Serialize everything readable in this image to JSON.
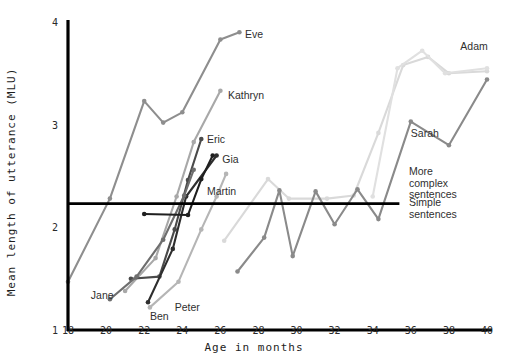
{
  "chart_data": {
    "type": "line",
    "title": "",
    "xlabel": "Age in months",
    "ylabel": "Mean length of utterance (MLU)",
    "xlim": [
      18,
      40
    ],
    "ylim": [
      1,
      4
    ],
    "xticks": [
      18,
      20,
      22,
      24,
      26,
      28,
      30,
      32,
      34,
      36,
      38,
      40
    ],
    "yticks": [
      1,
      2,
      3,
      4
    ],
    "grid": false,
    "legend_position": "inline-end-labels",
    "threshold": {
      "value": 2.23,
      "above_label": "More\ncomplex\nsentences",
      "below_label": "Simple\nsentences",
      "x_start": 18,
      "x_end": 35.4
    },
    "series": [
      {
        "name": "Eve",
        "color": "#8e8e8e",
        "label_x": 27.3,
        "label_y": 3.88,
        "points": [
          {
            "x": 18.0,
            "y": 1.47
          },
          {
            "x": 20.2,
            "y": 2.28
          },
          {
            "x": 22.0,
            "y": 3.23
          },
          {
            "x": 23.0,
            "y": 3.02
          },
          {
            "x": 24.0,
            "y": 3.12
          },
          {
            "x": 26.0,
            "y": 3.83
          },
          {
            "x": 27.0,
            "y": 3.9
          }
        ]
      },
      {
        "name": "Kathryn",
        "color": "#a8a8a8",
        "label_x": 26.4,
        "label_y": 3.29,
        "points": [
          {
            "x": 21.0,
            "y": 1.38
          },
          {
            "x": 22.6,
            "y": 1.7
          },
          {
            "x": 23.7,
            "y": 2.3
          },
          {
            "x": 24.6,
            "y": 2.83
          },
          {
            "x": 26.0,
            "y": 3.33
          }
        ]
      },
      {
        "name": "Eric",
        "color": "#4a4a4a",
        "label_x": 25.3,
        "label_y": 2.86,
        "points": [
          {
            "x": 21.3,
            "y": 1.5
          },
          {
            "x": 22.8,
            "y": 1.52
          },
          {
            "x": 23.6,
            "y": 1.98
          },
          {
            "x": 24.3,
            "y": 2.46
          },
          {
            "x": 25.0,
            "y": 2.86
          }
        ]
      },
      {
        "name": "Gia",
        "color": "#2e2e2e",
        "label_x": 26.1,
        "label_y": 2.67,
        "points": [
          {
            "x": 22.2,
            "y": 1.27
          },
          {
            "x": 23.5,
            "y": 1.79
          },
          {
            "x": 24.2,
            "y": 2.3
          },
          {
            "x": 25.8,
            "y": 2.7
          }
        ]
      },
      {
        "name": "Jane",
        "color": "#6e6e6e",
        "label_x": 19.2,
        "label_y": 1.34,
        "points": [
          {
            "x": 20.2,
            "y": 1.3
          },
          {
            "x": 21.6,
            "y": 1.52
          },
          {
            "x": 23.0,
            "y": 1.88
          },
          {
            "x": 24.1,
            "y": 2.31
          },
          {
            "x": 24.6,
            "y": 2.56
          }
        ]
      },
      {
        "name": "Ben",
        "color": "#b5b5b5",
        "label_x": 22.3,
        "label_y": 1.14,
        "points": [
          {
            "x": 22.3,
            "y": 1.22
          },
          {
            "x": 23.8,
            "y": 1.47
          },
          {
            "x": 25.0,
            "y": 1.98
          },
          {
            "x": 25.8,
            "y": 2.3
          },
          {
            "x": 26.3,
            "y": 2.52
          }
        ]
      },
      {
        "name": "Peter",
        "color": "#1f1f1f",
        "label_x": 23.6,
        "label_y": 1.22,
        "points": [
          {
            "x": 22.0,
            "y": 2.13
          },
          {
            "x": 24.3,
            "y": 2.12
          },
          {
            "x": 25.0,
            "y": 2.47
          },
          {
            "x": 25.6,
            "y": 2.7
          }
        ]
      },
      {
        "name": "Martin",
        "color": "#d9d9d9",
        "label_x": 25.3,
        "label_y": 2.35,
        "points": [
          {
            "x": 26.2,
            "y": 1.87
          },
          {
            "x": 28.5,
            "y": 2.47
          },
          {
            "x": 29.6,
            "y": 2.28
          },
          {
            "x": 31.6,
            "y": 2.28
          },
          {
            "x": 33.0,
            "y": 2.31
          },
          {
            "x": 34.3,
            "y": 2.92
          },
          {
            "x": 35.6,
            "y": 3.58
          },
          {
            "x": 36.9,
            "y": 3.66
          },
          {
            "x": 38.0,
            "y": 3.5
          },
          {
            "x": 40.0,
            "y": 3.52
          }
        ]
      },
      {
        "name": "Sarah",
        "color": "#8a8a8a",
        "label_x": 36.0,
        "label_y": 2.92,
        "points": [
          {
            "x": 26.9,
            "y": 1.57
          },
          {
            "x": 28.3,
            "y": 1.9
          },
          {
            "x": 29.1,
            "y": 2.36
          },
          {
            "x": 29.8,
            "y": 1.72
          },
          {
            "x": 31.0,
            "y": 2.35
          },
          {
            "x": 32.0,
            "y": 2.03
          },
          {
            "x": 33.2,
            "y": 2.37
          },
          {
            "x": 34.3,
            "y": 2.08
          },
          {
            "x": 36.0,
            "y": 3.03
          },
          {
            "x": 38.0,
            "y": 2.8
          },
          {
            "x": 40.0,
            "y": 3.44
          }
        ]
      },
      {
        "name": "Adam",
        "color": "#e0e0e0",
        "label_x": 38.6,
        "label_y": 3.77,
        "points": [
          {
            "x": 34.0,
            "y": 2.3
          },
          {
            "x": 35.3,
            "y": 3.55
          },
          {
            "x": 36.6,
            "y": 3.72
          },
          {
            "x": 37.8,
            "y": 3.5
          },
          {
            "x": 40.0,
            "y": 3.55
          }
        ]
      }
    ],
    "point_labels": [
      {
        "name": "Eve",
        "text": "Eve"
      },
      {
        "name": "Kathryn",
        "text": "Kathryn"
      },
      {
        "name": "Eric",
        "text": "Eric"
      },
      {
        "name": "Gia",
        "text": "Gia"
      },
      {
        "name": "Martin",
        "text": "Martin"
      },
      {
        "name": "Jane",
        "text": "Jane"
      },
      {
        "name": "Ben",
        "text": "Ben"
      },
      {
        "name": "Peter",
        "text": "Peter"
      },
      {
        "name": "Sarah",
        "text": "Sarah"
      },
      {
        "name": "Adam",
        "text": "Adam"
      }
    ]
  },
  "axes": {
    "xlabel": "Age in months",
    "ylabel": "Mean length of utterance (MLU)",
    "xticks": [
      "18",
      "20",
      "22",
      "24",
      "26",
      "28",
      "30",
      "32",
      "34",
      "36",
      "38",
      "40"
    ],
    "yticks": [
      "4",
      "3",
      "2",
      "1"
    ]
  },
  "annotations": {
    "more_complex_line1": "More",
    "more_complex_line2": "complex",
    "more_complex_line3": "sentences",
    "simple_line1": "Simple",
    "simple_line2": "sentences"
  },
  "colors": {
    "axis": "#000000",
    "threshold": "#000000",
    "background": "#ffffff",
    "text": "#2b2b2b"
  }
}
